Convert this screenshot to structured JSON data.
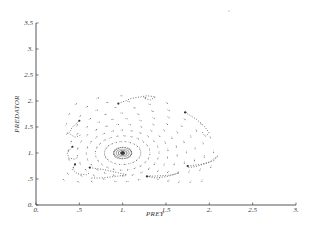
{
  "chart_data": {
    "type": "scatter",
    "subtype": "phase-portrait / direction field",
    "title": "",
    "xlabel": "PREY",
    "ylabel": "PREDATOR",
    "xlim": [
      0,
      3
    ],
    "ylim": [
      0,
      3.5
    ],
    "x_ticks": [
      "0.",
      ".5",
      "1.",
      "1.5",
      "2.",
      "2.5",
      "3."
    ],
    "x_tick_values": [
      0,
      0.5,
      1,
      1.5,
      2,
      2.5,
      3
    ],
    "y_ticks": [
      "0.",
      ".5",
      "1.",
      "1.5",
      "2.",
      "2.5",
      "3.",
      "3.5"
    ],
    "y_tick_values": [
      0,
      0.5,
      1,
      1.5,
      2,
      2.5,
      3,
      3.5
    ],
    "grid": false,
    "legend": null,
    "equilibrium": {
      "x": 1.0,
      "y": 1.0
    },
    "field": {
      "description": "dotted direction-field arrows arranged on rings around the equilibrium",
      "rings": [
        0.1,
        0.2,
        0.3,
        0.4,
        0.5,
        0.6,
        0.7,
        0.8,
        0.9,
        1.0
      ],
      "points_per_ring": 24
    },
    "trajectories": [
      {
        "name": "traj-1",
        "points": [
          [
            0.62,
            0.72
          ],
          [
            0.78,
            0.68
          ],
          [
            0.95,
            0.62
          ],
          [
            1.05,
            0.58
          ],
          [
            0.92,
            0.55
          ],
          [
            0.75,
            0.52
          ],
          [
            0.62,
            0.52
          ]
        ]
      },
      {
        "name": "traj-2",
        "points": [
          [
            1.28,
            0.55
          ],
          [
            1.42,
            0.56
          ],
          [
            1.58,
            0.58
          ],
          [
            1.65,
            0.62
          ],
          [
            1.52,
            0.55
          ],
          [
            1.38,
            0.52
          ],
          [
            1.28,
            0.55
          ]
        ]
      },
      {
        "name": "traj-3",
        "points": [
          [
            1.75,
            0.75
          ],
          [
            1.9,
            0.78
          ],
          [
            2.05,
            0.85
          ],
          [
            2.1,
            0.95
          ],
          [
            2.0,
            0.82
          ],
          [
            1.85,
            0.74
          ],
          [
            1.75,
            0.72
          ]
        ]
      },
      {
        "name": "traj-4",
        "points": [
          [
            1.72,
            1.78
          ],
          [
            1.85,
            1.65
          ],
          [
            1.95,
            1.5
          ],
          [
            2.0,
            1.38
          ],
          [
            1.95,
            1.32
          ],
          [
            1.92,
            1.4
          ]
        ]
      },
      {
        "name": "traj-5",
        "points": [
          [
            0.95,
            1.95
          ],
          [
            1.1,
            2.05
          ],
          [
            1.28,
            2.1
          ],
          [
            1.38,
            2.08
          ],
          [
            1.32,
            2.02
          ],
          [
            1.25,
            2.05
          ]
        ]
      },
      {
        "name": "traj-6",
        "points": [
          [
            0.5,
            1.62
          ],
          [
            0.42,
            1.5
          ],
          [
            0.38,
            1.38
          ],
          [
            0.45,
            1.3
          ],
          [
            0.52,
            1.35
          ]
        ]
      },
      {
        "name": "traj-7",
        "points": [
          [
            0.42,
            1.12
          ],
          [
            0.36,
            1.0
          ],
          [
            0.38,
            0.9
          ],
          [
            0.45,
            0.88
          ],
          [
            0.48,
            0.92
          ]
        ]
      },
      {
        "name": "traj-8",
        "points": [
          [
            0.45,
            0.78
          ],
          [
            0.42,
            0.68
          ],
          [
            0.48,
            0.6
          ],
          [
            0.58,
            0.58
          ],
          [
            0.62,
            0.62
          ]
        ]
      }
    ],
    "annotations": []
  }
}
